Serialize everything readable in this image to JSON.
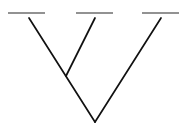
{
  "diagram": {
    "type": "cladogram",
    "orientation": "root-bottom",
    "colors": {
      "background": "#ffffff",
      "branch": "#111111",
      "tip_bar": "#6e6e6e"
    },
    "tips": [
      {
        "id": "tip-1",
        "label": "",
        "bar": {
          "x1": 8,
          "x2": 45,
          "y": 13
        }
      },
      {
        "id": "tip-2",
        "label": "",
        "bar": {
          "x1": 76,
          "x2": 113,
          "y": 13
        }
      },
      {
        "id": "tip-3",
        "label": "",
        "bar": {
          "x1": 142,
          "x2": 179,
          "y": 13
        }
      }
    ],
    "branches": [
      {
        "id": "branch-left",
        "from": {
          "x": 29,
          "y": 18
        },
        "to": {
          "x": 95,
          "y": 122
        }
      },
      {
        "id": "branch-middle",
        "from": {
          "x": 95,
          "y": 18
        },
        "to": {
          "x": 66,
          "y": 76
        }
      },
      {
        "id": "branch-right",
        "from": {
          "x": 161,
          "y": 18
        },
        "to": {
          "x": 95,
          "y": 122
        }
      }
    ],
    "nodes": [
      {
        "id": "inner-node",
        "x": 66,
        "y": 76
      },
      {
        "id": "root-node",
        "x": 95,
        "y": 122
      }
    ]
  }
}
